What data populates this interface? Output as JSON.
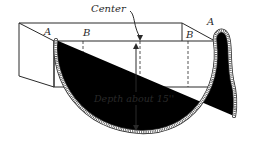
{
  "figure": {
    "labels": {
      "center": "Center",
      "corner_left": "A",
      "corner_right": "A",
      "mark_left": "B",
      "mark_right": "B",
      "depth": "Depth about 15''"
    },
    "colors": {
      "line": "#2a2a2a",
      "background": "#ffffff"
    }
  }
}
